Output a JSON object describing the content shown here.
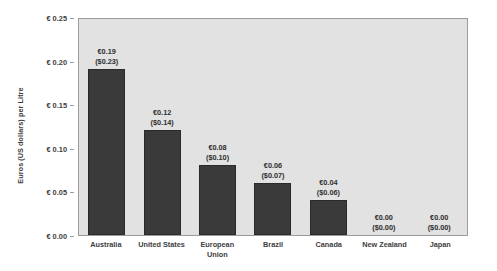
{
  "chart_data": {
    "type": "bar",
    "title": "",
    "xlabel": "",
    "ylabel": "Euros (US dollars) per Litre",
    "ylim": [
      0,
      0.25
    ],
    "ytick_values": [
      0.0,
      0.05,
      0.1,
      0.15,
      0.2,
      0.25
    ],
    "ytick_labels": [
      "€ 0.00",
      "€ 0.05",
      "€ 0.10",
      "€ 0.15",
      "€ 0.20",
      "€ 0.25"
    ],
    "grid": false,
    "legend": "none",
    "plot_background": "#e2e2e2",
    "bar_color": "#3a3a3a",
    "categories": [
      "Australia",
      "United States",
      "European Union",
      "Brazil",
      "Canada",
      "New Zealand",
      "Japan"
    ],
    "values": [
      0.19,
      0.12,
      0.08,
      0.06,
      0.04,
      0.0,
      0.0
    ],
    "data_labels_euro": [
      "€0.19",
      "€0.12",
      "€0.08",
      "€0.06",
      "€0.04",
      "€0.00",
      "€0.00"
    ],
    "data_labels_usd": [
      "($0.23)",
      "($0.14)",
      "($0.10)",
      "($0.07)",
      "($0.06)",
      "($0.00)",
      "($0.00)"
    ]
  }
}
